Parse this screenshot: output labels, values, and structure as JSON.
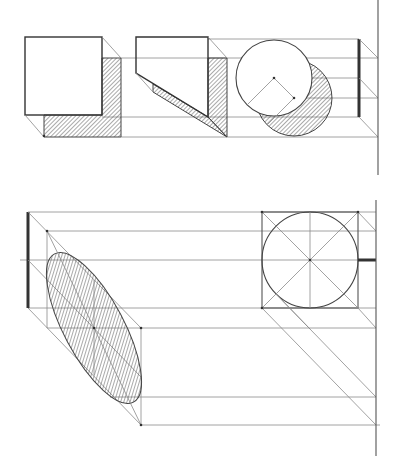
{
  "figure": {
    "top_panel": {
      "objects": [
        "square-with-shadow",
        "pentagon-prism-with-shadow",
        "circle-with-shadow"
      ],
      "square": {
        "x": 25,
        "y": 37,
        "w": 77,
        "h": 78,
        "shadow_offset": [
          19,
          21
        ]
      },
      "pentagon": {
        "points": [
          [
            136,
            37
          ],
          [
            208,
            37
          ],
          [
            208,
            117
          ],
          [
            136,
            73
          ]
        ]
      },
      "circle": {
        "cx": 274,
        "cy": 78,
        "r": 38,
        "shadow_cx": 294,
        "shadow_cy": 98
      },
      "profile_bar": {
        "x": 359,
        "y1": 39,
        "y2": 117
      },
      "ground_line": {
        "x": 378,
        "y1": 0,
        "y2": 175
      },
      "horizontal_lines_y": [
        39,
        60,
        78,
        97,
        117,
        137
      ]
    },
    "bottom_panel": {
      "objects": [
        "circle-in-square",
        "ellipse-shadow-parallelogram"
      ],
      "square": {
        "x": 262,
        "y": 212,
        "w": 96,
        "h": 96
      },
      "circle": {
        "cx": 310,
        "cy": 260,
        "r": 48
      },
      "ellipse": {
        "cx": 94,
        "cy": 328,
        "rx": 30,
        "ry": 82,
        "rotate": -28
      },
      "profile_bar": {
        "x": 28,
        "y1": 212,
        "y2": 308
      },
      "ground_line": {
        "x": 376,
        "y1": 200,
        "y2": 456
      },
      "horizontal_lines_y": [
        212,
        231,
        260,
        308,
        328,
        397,
        425
      ]
    },
    "colors": {
      "line": "#555555",
      "hatch": "#444444",
      "background": "#ffffff"
    }
  }
}
